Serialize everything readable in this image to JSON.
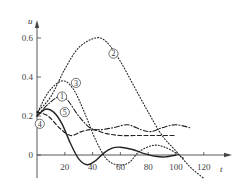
{
  "chart_data": {
    "type": "line",
    "title": "",
    "xlabel": "t",
    "ylabel": "u",
    "xlim": [
      0,
      130
    ],
    "ylim": [
      -0.1,
      0.65
    ],
    "xticks": [
      20,
      40,
      60,
      80,
      100,
      120
    ],
    "yticks": [
      0,
      0.2,
      0.4,
      0.6
    ],
    "grid": false,
    "legend": "inline circled numbers",
    "series": [
      {
        "name": "①",
        "style": "dash-dot",
        "points": [
          [
            0,
            0.2
          ],
          [
            8,
            0.26
          ],
          [
            16,
            0.3
          ],
          [
            22,
            0.28
          ],
          [
            30,
            0.2
          ],
          [
            38,
            0.14
          ],
          [
            45,
            0.13
          ],
          [
            55,
            0.14
          ],
          [
            65,
            0.155
          ],
          [
            75,
            0.13
          ],
          [
            82,
            0.12
          ],
          [
            90,
            0.14
          ],
          [
            100,
            0.155
          ],
          [
            110,
            0.14
          ]
        ],
        "label_pos": [
          18,
          0.3
        ]
      },
      {
        "name": "②",
        "style": "dotted",
        "points": [
          [
            0,
            0.22
          ],
          [
            10,
            0.3
          ],
          [
            20,
            0.44
          ],
          [
            30,
            0.55
          ],
          [
            42,
            0.6
          ],
          [
            50,
            0.58
          ],
          [
            60,
            0.48
          ],
          [
            70,
            0.35
          ],
          [
            80,
            0.22
          ],
          [
            90,
            0.1
          ],
          [
            100,
            0.02
          ],
          [
            110,
            -0.06
          ],
          [
            120,
            -0.12
          ]
        ],
        "label_pos": [
          55,
          0.52
        ]
      },
      {
        "name": "③",
        "style": "dotted",
        "points": [
          [
            0,
            0.21
          ],
          [
            8,
            0.32
          ],
          [
            18,
            0.38
          ],
          [
            26,
            0.34
          ],
          [
            34,
            0.22
          ],
          [
            42,
            0.08
          ],
          [
            50,
            -0.02
          ],
          [
            58,
            -0.05
          ],
          [
            66,
            -0.04
          ],
          [
            74,
            0.02
          ],
          [
            84,
            0.05
          ],
          [
            92,
            0.04
          ],
          [
            100,
            0.01
          ],
          [
            106,
            -0.02
          ]
        ],
        "label_pos": [
          28,
          0.37
        ]
      },
      {
        "name": "④",
        "style": "dashed",
        "points": [
          [
            0,
            0.22
          ],
          [
            8,
            0.2
          ],
          [
            16,
            0.14
          ],
          [
            24,
            0.1
          ],
          [
            32,
            0.12
          ],
          [
            40,
            0.13
          ],
          [
            50,
            0.11
          ],
          [
            60,
            0.1
          ],
          [
            70,
            0.1
          ],
          [
            80,
            0.1
          ],
          [
            90,
            0.1
          ],
          [
            100,
            0.1
          ]
        ],
        "label_pos": [
          2,
          0.16
        ]
      },
      {
        "name": "⑤",
        "style": "solid",
        "points": [
          [
            0,
            0.2
          ],
          [
            6,
            0.235
          ],
          [
            12,
            0.22
          ],
          [
            18,
            0.16
          ],
          [
            24,
            0.06
          ],
          [
            30,
            -0.02
          ],
          [
            36,
            -0.05
          ],
          [
            42,
            -0.03
          ],
          [
            48,
            0.01
          ],
          [
            54,
            0.035
          ],
          [
            60,
            0.04
          ],
          [
            68,
            0.03
          ],
          [
            76,
            0.01
          ],
          [
            84,
            -0.005
          ],
          [
            92,
            -0.01
          ],
          [
            100,
            0
          ]
        ],
        "label_pos": [
          20,
          0.22
        ]
      }
    ]
  },
  "axes": {
    "x_title": "t",
    "y_title": "u",
    "x_tick_labels": [
      "20",
      "40",
      "60",
      "80",
      "100",
      "120"
    ],
    "y_tick_labels": [
      "0",
      "0.2",
      "0.4",
      "0.6"
    ]
  }
}
